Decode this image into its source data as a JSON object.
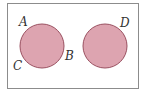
{
  "diagram": {
    "type": "venn-disjoint-sets",
    "universe_rect": {
      "x": 7,
      "y": 3,
      "width": 131,
      "height": 85,
      "stroke": "#8c8c8c"
    },
    "circles": [
      {
        "id": "left",
        "cx": 42,
        "cy": 46,
        "r": 22,
        "fill": "#dda4b0",
        "stroke": "#9a5060"
      },
      {
        "id": "right",
        "cx": 105,
        "cy": 46,
        "r": 22,
        "fill": "#dda4b0",
        "stroke": "#9a5060"
      }
    ],
    "labels": [
      {
        "id": "A",
        "text": "A",
        "x": 19,
        "y": 26
      },
      {
        "id": "B",
        "text": "B",
        "x": 65,
        "y": 60
      },
      {
        "id": "C",
        "text": "C",
        "x": 13,
        "y": 70
      },
      {
        "id": "D",
        "text": "D",
        "x": 120,
        "y": 27
      }
    ]
  }
}
